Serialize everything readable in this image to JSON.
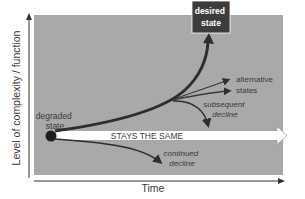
{
  "diagram": {
    "axes": {
      "y_label": "Level of complexity / function",
      "x_label": "Time"
    },
    "nodes": {
      "start": {
        "line1": "degraded",
        "line2": "state"
      },
      "goal": {
        "line1": "desired",
        "line2": "state"
      }
    },
    "paths": {
      "stays": "STAYS THE SAME",
      "alternative": {
        "line1": "alternative",
        "line2": "states"
      },
      "subsequent_decline": {
        "line1": "subsequent",
        "line2": "decline"
      },
      "continued_decline": {
        "line1": "continued",
        "line2": "decline"
      }
    },
    "colors": {
      "panel": "#a9a9a9",
      "goal_box": "#3c3c3c",
      "arrow_dark": "#2e2e2e",
      "stays_fill": "#ffffff",
      "axis": "#333333"
    }
  }
}
